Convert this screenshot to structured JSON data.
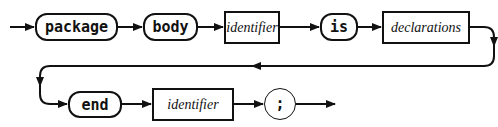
{
  "diagram": {
    "type": "railroad-syntax-diagram",
    "row1": {
      "nodes": [
        {
          "kind": "terminal",
          "label": "package"
        },
        {
          "kind": "terminal",
          "label": "body"
        },
        {
          "kind": "nonterminal",
          "label": "identifier"
        },
        {
          "kind": "terminal",
          "label": "is"
        },
        {
          "kind": "nonterminal",
          "label": "declarations"
        }
      ]
    },
    "row2": {
      "nodes": [
        {
          "kind": "terminal",
          "label": "end"
        },
        {
          "kind": "nonterminal",
          "label": "identifier"
        },
        {
          "kind": "terminal-circle",
          "label": ";"
        }
      ]
    },
    "colors": {
      "stroke": "#111111",
      "background": "#ffffff"
    }
  }
}
